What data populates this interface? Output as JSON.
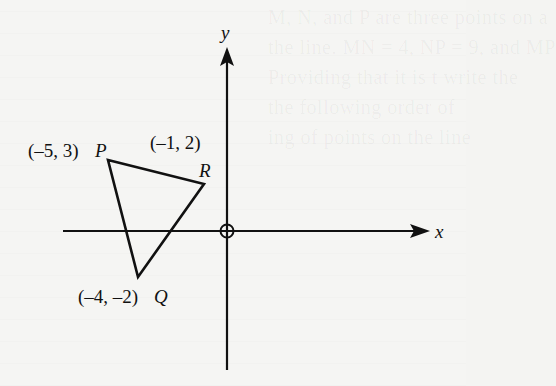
{
  "diagram": {
    "type": "coordinate-plane-triangle",
    "axes": {
      "x_label": "x",
      "y_label": "y",
      "origin_marker": "circle-cross"
    },
    "points": [
      {
        "name": "P",
        "coords": [
          -5,
          3
        ],
        "label": "(–5, 3)"
      },
      {
        "name": "Q",
        "coords": [
          -4,
          -2
        ],
        "label": "(–4, –2)"
      },
      {
        "name": "R",
        "coords": [
          -1,
          2
        ],
        "label": "(–1, 2)"
      }
    ],
    "labels": {
      "p_coord": "(–5, 3)",
      "p_name": "P",
      "r_coord": "(–1, 2)",
      "r_name": "R",
      "q_coord": "(–4, –2)",
      "q_name": "Q"
    },
    "colors": {
      "ink": "#111111",
      "paper": "#f5f5f3"
    }
  },
  "background_bleed_text": [
    "M, N, and P are three points on a",
    "the line. MN = 4, NP = 9, and MP",
    "Providing that it is t write the",
    "the following order of",
    "ing of points on the line"
  ]
}
